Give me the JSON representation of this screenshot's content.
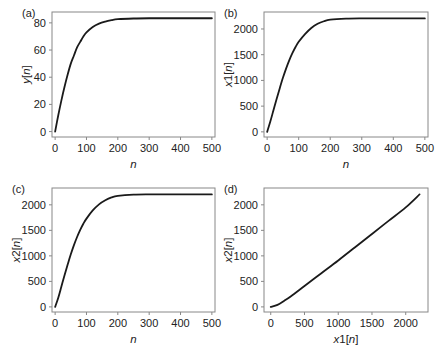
{
  "chart_data": [
    {
      "panel": "(a)",
      "type": "line",
      "title": "",
      "xlabel": "n",
      "ylabel": "y[n]",
      "xlim": [
        -10,
        510
      ],
      "ylim": [
        -4,
        88
      ],
      "xticks": [
        0,
        100,
        200,
        300,
        400,
        500
      ],
      "yticks": [
        0,
        20,
        40,
        60,
        80
      ],
      "grid": false,
      "series": [
        {
          "name": "y[n]",
          "x": [
            0,
            10,
            20,
            30,
            40,
            50,
            60,
            70,
            80,
            90,
            100,
            120,
            140,
            160,
            180,
            200,
            250,
            300,
            350,
            400,
            450,
            500
          ],
          "y": [
            0,
            12,
            23,
            33,
            42,
            50,
            56,
            62,
            66,
            70,
            73,
            77,
            79.5,
            81,
            82,
            82.7,
            83.2,
            83.4,
            83.4,
            83.4,
            83.4,
            83.4
          ]
        }
      ]
    },
    {
      "panel": "(b)",
      "type": "line",
      "title": "",
      "xlabel": "n",
      "ylabel": "x1[n]",
      "xlim": [
        -10,
        510
      ],
      "ylim": [
        -100,
        2330
      ],
      "xticks": [
        0,
        100,
        200,
        300,
        400,
        500
      ],
      "yticks": [
        0,
        500,
        1000,
        1500,
        2000
      ],
      "grid": false,
      "series": [
        {
          "name": "x1[n]",
          "x": [
            0,
            10,
            20,
            30,
            40,
            50,
            60,
            70,
            80,
            90,
            100,
            120,
            140,
            160,
            180,
            200,
            250,
            300,
            350,
            400,
            450,
            500
          ],
          "y": [
            0,
            200,
            420,
            640,
            850,
            1050,
            1230,
            1390,
            1530,
            1650,
            1750,
            1900,
            2020,
            2100,
            2150,
            2180,
            2200,
            2205,
            2205,
            2205,
            2205,
            2205
          ]
        }
      ]
    },
    {
      "panel": "(c)",
      "type": "line",
      "title": "",
      "xlabel": "n",
      "ylabel": "x2[n]",
      "xlim": [
        -10,
        510
      ],
      "ylim": [
        -100,
        2330
      ],
      "xticks": [
        0,
        100,
        200,
        300,
        400,
        500
      ],
      "yticks": [
        0,
        500,
        1000,
        1500,
        2000
      ],
      "grid": false,
      "series": [
        {
          "name": "x2[n]",
          "x": [
            0,
            10,
            20,
            30,
            40,
            50,
            60,
            70,
            80,
            90,
            100,
            120,
            140,
            160,
            180,
            200,
            250,
            300,
            350,
            400,
            450,
            500
          ],
          "y": [
            0,
            180,
            400,
            620,
            830,
            1030,
            1210,
            1370,
            1510,
            1630,
            1730,
            1890,
            2010,
            2090,
            2145,
            2175,
            2200,
            2205,
            2205,
            2205,
            2205,
            2205
          ]
        }
      ]
    },
    {
      "panel": "(d)",
      "type": "line",
      "title": "",
      "xlabel": "x1[n]",
      "ylabel": "x2[n]",
      "xlim": [
        -100,
        2330
      ],
      "ylim": [
        -100,
        2330
      ],
      "xticks": [
        0,
        500,
        1000,
        1500,
        2000
      ],
      "yticks": [
        0,
        500,
        1000,
        1500,
        2000
      ],
      "grid": false,
      "series": [
        {
          "name": "x2 vs x1",
          "x": [
            0,
            100,
            200,
            300,
            500,
            750,
            1000,
            1250,
            1500,
            1750,
            2000,
            2205
          ],
          "y": [
            0,
            40,
            120,
            210,
            410,
            660,
            910,
            1170,
            1430,
            1690,
            1950,
            2205
          ]
        }
      ]
    }
  ],
  "panels": {
    "a": {
      "label": "(a)",
      "xlabel": "n",
      "ylabel": "y[n]"
    },
    "b": {
      "label": "(b)",
      "xlabel": "n",
      "ylabel": "x1[n]"
    },
    "c": {
      "label": "(c)",
      "xlabel": "n",
      "ylabel": "x2[n]"
    },
    "d": {
      "label": "(d)",
      "xlabel": "x1[n]",
      "ylabel": "x2[n]"
    }
  },
  "style": {
    "line_color": "#1a1a1a",
    "axis_color": "#888888",
    "text_color": "#222222"
  }
}
